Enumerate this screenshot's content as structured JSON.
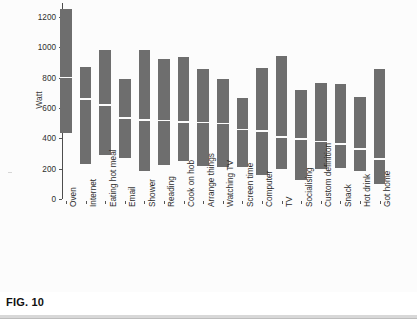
{
  "figure": {
    "caption": "FIG. 10"
  },
  "chart_data": {
    "type": "bar",
    "title": "",
    "subtitle": "",
    "xlabel": "",
    "ylabel": "Watt",
    "ylim": [
      0,
      1290
    ],
    "yticks": [
      0,
      200,
      400,
      600,
      800,
      1000,
      1200
    ],
    "ytick_labels": [
      "0",
      "200",
      "400",
      "600",
      "800",
      "1000",
      "1200"
    ],
    "grid": false,
    "legend": null,
    "note": "Floating bars (range bars) with a white median line inside each bar. Values in Watt.",
    "categories": [
      "Oven",
      "Internet",
      "Eating hot meal",
      "Email",
      "Shower",
      "Reading",
      "Cook on hob",
      "Arrange things",
      "Watching TV",
      "Screen time",
      "Computer",
      "TV",
      "Socialising",
      "Custom definition",
      "Snack",
      "Hot drink",
      "Got home"
    ],
    "series": [
      {
        "name": "top",
        "values": [
          1250,
          870,
          985,
          790,
          980,
          925,
          935,
          855,
          790,
          665,
          865,
          945,
          720,
          765,
          760,
          672,
          860
        ]
      },
      {
        "name": "median",
        "values": [
          800,
          660,
          620,
          535,
          520,
          517,
          508,
          505,
          498,
          458,
          450,
          408,
          396,
          378,
          363,
          328,
          262
        ]
      },
      {
        "name": "bottom",
        "values": [
          438,
          228,
          292,
          268,
          185,
          222,
          252,
          215,
          208,
          208,
          158,
          198,
          122,
          197,
          205,
          182,
          100
        ]
      }
    ]
  }
}
